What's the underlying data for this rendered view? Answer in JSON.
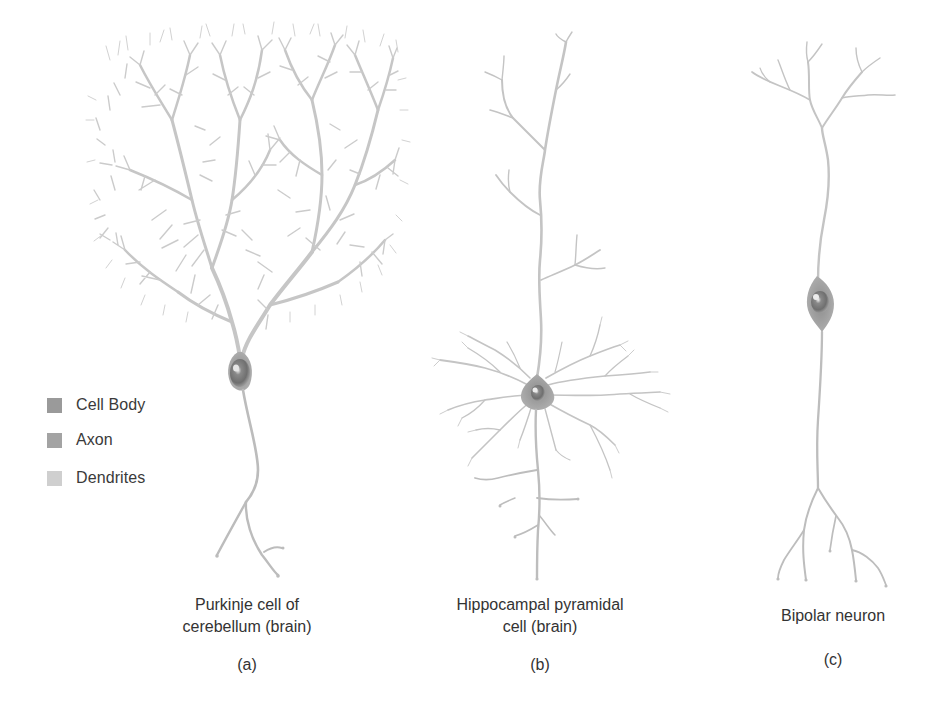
{
  "figure": {
    "legend": {
      "items": [
        {
          "label": "Cell Body",
          "color": "#9a9a9a"
        },
        {
          "label": "Axon",
          "color": "#a3a3a3"
        },
        {
          "label": "Dendrites",
          "color": "#cfcfcf"
        }
      ]
    },
    "panels": [
      {
        "id": "a",
        "title_line1": "Purkinje cell of",
        "title_line2": "cerebellum (brain)",
        "letter": "(a)"
      },
      {
        "id": "b",
        "title_line1": "Hippocampal pyramidal",
        "title_line2": "cell (brain)",
        "letter": "(b)"
      },
      {
        "id": "c",
        "title_line1": "Bipolar neuron",
        "title_line2": "",
        "letter": "(c)"
      }
    ],
    "colors": {
      "dendrite": "#c4c4c4",
      "axon": "#bdbdbd",
      "soma": "#8e8e8e",
      "soma_highlight": "#e8e8e8",
      "nucleus": "#5e5e5e",
      "text": "#333333",
      "background": "#ffffff"
    }
  }
}
